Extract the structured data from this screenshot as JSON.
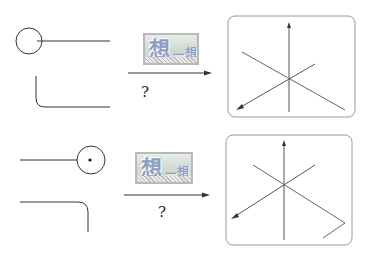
{
  "rows": [
    {
      "badge": {
        "big": "想",
        "dash": "一",
        "small": "想",
        "label": "想一想"
      },
      "question": "?"
    },
    {
      "badge": {
        "big": "想",
        "dash": "一",
        "small": "想",
        "label": "想一想"
      },
      "question": "?"
    }
  ],
  "colors": {
    "line": "#333333",
    "box_border": "#9a9a9a",
    "badge_text": "#8f9dc2"
  }
}
